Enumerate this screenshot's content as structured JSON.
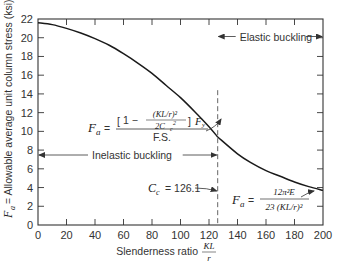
{
  "chart_data": {
    "type": "line",
    "title": "",
    "xlabel": "Slenderness ratio KL/r",
    "xlabel_text": "Slenderness ratio",
    "xlabel_frac": {
      "num": "KL",
      "den": "r"
    },
    "ylabel": "Fa = Allowable average unit column stress (ksi)",
    "ylabel_text": "= Allowable average unit column stress (ksi)",
    "ylabel_symbol": "F",
    "ylabel_sub": "a",
    "xlim": [
      0,
      200
    ],
    "ylim": [
      0,
      22
    ],
    "xticks": [
      0,
      20,
      40,
      60,
      80,
      100,
      120,
      140,
      160,
      180,
      200
    ],
    "yticks": [
      0,
      2,
      4,
      6,
      8,
      10,
      12,
      14,
      16,
      18,
      20,
      22
    ],
    "grid": false,
    "series": [
      {
        "name": "Inelastic (AISC parabola)",
        "x": [
          0,
          10,
          20,
          30,
          40,
          50,
          60,
          70,
          80,
          90,
          100,
          110,
          120,
          126.1
        ],
        "values": [
          21.6,
          21.4,
          21.0,
          20.5,
          19.9,
          19.2,
          18.3,
          17.3,
          16.2,
          14.9,
          13.6,
          12.1,
          10.5,
          9.4
        ]
      },
      {
        "name": "Elastic (Euler)",
        "x": [
          126.1,
          140,
          150,
          160,
          170,
          180,
          190,
          200
        ],
        "values": [
          9.4,
          7.6,
          6.6,
          5.8,
          5.2,
          4.6,
          4.1,
          3.7
        ]
      }
    ],
    "annotations": {
      "cc_label": "C",
      "cc_sub": "c",
      "cc_value": "= 126.1",
      "cc_x": 126.1,
      "elastic_region": "Elastic buckling",
      "inelastic_region": "Inelastic buckling",
      "inelastic_formula": {
        "lhs": "F",
        "lhs_sub": "a",
        "eq": "=",
        "num_bracket": "1 −",
        "num_frac_num": "(KL/r)²",
        "num_frac_den": "2C",
        "num_frac_den_sub": "c",
        "num_frac_den_sup": "2",
        "fy": "F",
        "fy_sub": "y",
        "den": "F.S."
      },
      "elastic_formula": {
        "lhs": "F",
        "lhs_sub": "a",
        "eq": "=",
        "num": "12π²E",
        "den": "23 (KL/r)²"
      }
    },
    "colors": {
      "curve": "#1a1a1a",
      "axis": "#333333",
      "dashed": "#555555"
    }
  }
}
